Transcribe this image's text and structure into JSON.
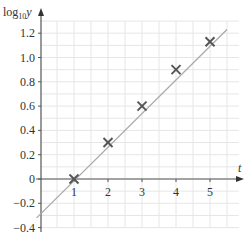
{
  "chart_data": {
    "type": "scatter",
    "title": "",
    "xlabel": "t",
    "ylabel": "log10 y",
    "ylabel_main": "log",
    "ylabel_sub": "10",
    "ylabel_var": "y",
    "x_ticks": [
      1,
      2,
      3,
      4,
      5
    ],
    "y_ticks": [
      "-0.4",
      "-0.2",
      "0",
      "0.2",
      "0.4",
      "0.6",
      "0.8",
      "1.0",
      "1.2"
    ],
    "xlim": [
      -0.1,
      6.0
    ],
    "ylim": [
      -0.4,
      1.3
    ],
    "grid": true,
    "series": [
      {
        "name": "data points",
        "marker": "x",
        "x": [
          1,
          2,
          3,
          4,
          5
        ],
        "values": [
          0.0,
          0.3,
          0.6,
          0.9,
          1.13
        ]
      },
      {
        "name": "line of best fit",
        "type": "line",
        "x": [
          -0.1,
          5.5
        ],
        "values": [
          -0.32,
          1.23
        ]
      }
    ],
    "colors": {
      "marker": "#555555",
      "line": "#aaaaaa",
      "axis": "#555555",
      "grid": "#e6e6e6"
    }
  }
}
